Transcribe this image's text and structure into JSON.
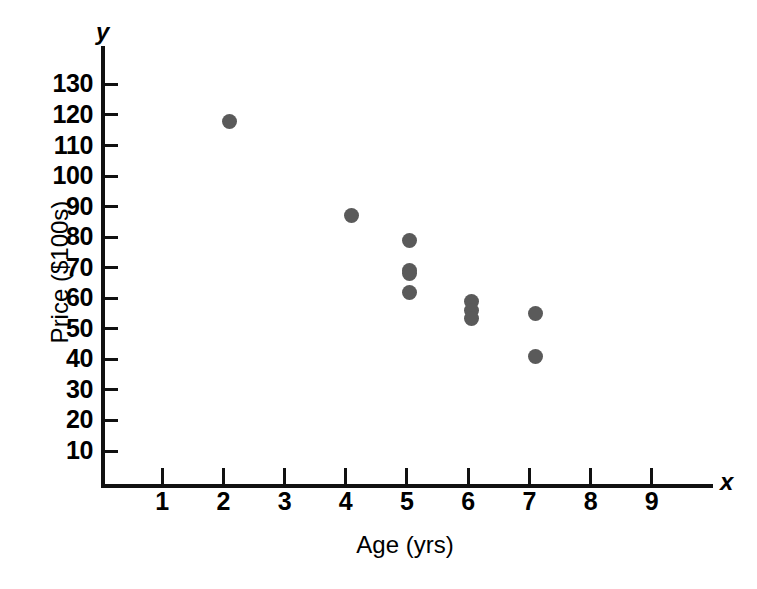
{
  "figure": {
    "background_color": "#ffffff",
    "ink_color": "#111111",
    "marker_color": "#5a5a5a"
  },
  "chart_data": {
    "type": "scatter",
    "title": "",
    "subtitle": "",
    "xlabel": "Age (yrs)",
    "ylabel": "Price ($100s)",
    "x_variable_symbol": "x",
    "y_variable_symbol": "y",
    "xlim": [
      0,
      10
    ],
    "ylim": [
      0,
      135
    ],
    "grid": false,
    "legend": null,
    "legend_position": "none",
    "xticks": [
      1,
      2,
      3,
      4,
      5,
      6,
      7,
      8,
      9
    ],
    "xticklabels": [
      "1",
      "2",
      "3",
      "4",
      "5",
      "6",
      "7",
      "8",
      "9"
    ],
    "yticks": [
      10,
      20,
      30,
      40,
      50,
      60,
      70,
      80,
      90,
      100,
      110,
      120,
      130
    ],
    "yticklabels": [
      "10",
      "20",
      "30",
      "40",
      "50",
      "60",
      "70",
      "80",
      "90",
      "100",
      "110",
      "120",
      "130"
    ],
    "series": [
      {
        "name": "Used car price vs age",
        "marker": "filled-circle",
        "color": "#5a5a5a",
        "points": [
          {
            "x": 2.1,
            "y": 118
          },
          {
            "x": 4.1,
            "y": 87
          },
          {
            "x": 5.05,
            "y": 79
          },
          {
            "x": 5.05,
            "y": 69
          },
          {
            "x": 5.05,
            "y": 68
          },
          {
            "x": 5.05,
            "y": 62
          },
          {
            "x": 6.05,
            "y": 59
          },
          {
            "x": 6.05,
            "y": 56
          },
          {
            "x": 6.05,
            "y": 53.5
          },
          {
            "x": 7.1,
            "y": 55
          },
          {
            "x": 7.1,
            "y": 41
          }
        ]
      }
    ]
  }
}
